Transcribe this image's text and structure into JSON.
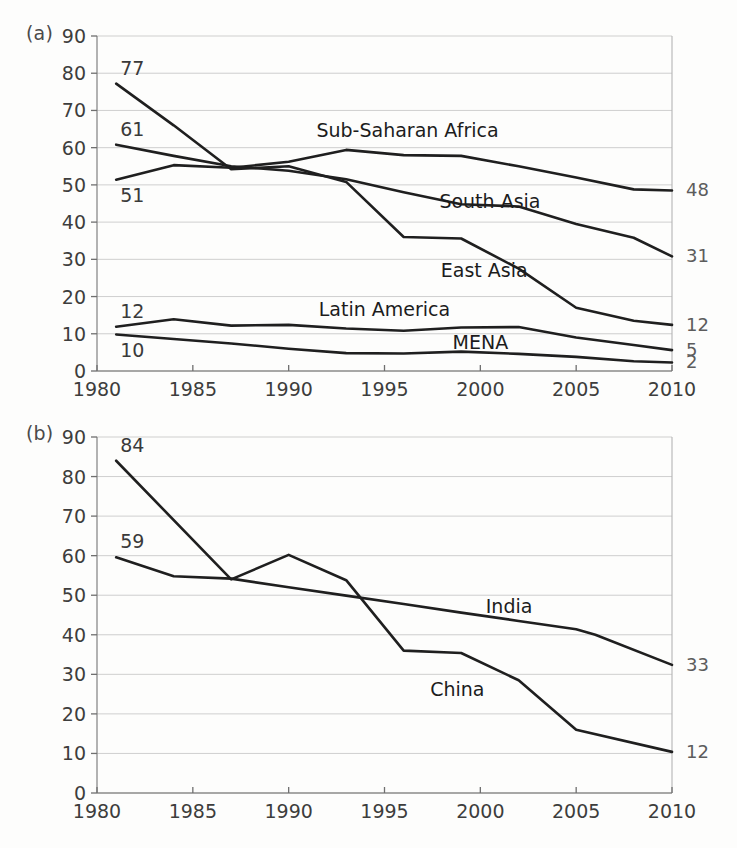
{
  "figure": {
    "background": "#fdfdfc",
    "line_color": "#1f1f1f",
    "grid_color": "#c9c9c9",
    "label_color": "#5c5c5c"
  },
  "panels": [
    {
      "tag": "(a)"
    },
    {
      "tag": "(b)"
    }
  ],
  "chart_data": [
    {
      "type": "line",
      "panel": "(a)",
      "title": "",
      "xlabel": "",
      "ylabel": "",
      "xlim": [
        1980,
        2010
      ],
      "ylim": [
        0,
        90
      ],
      "grid": true,
      "legend": "inline-annotations",
      "xticks": [
        1980,
        1985,
        1990,
        1995,
        2000,
        2005,
        2010
      ],
      "yticks": [
        0,
        10,
        20,
        30,
        40,
        50,
        60,
        70,
        80,
        90
      ],
      "series": [
        {
          "name": "Sub-Saharan Africa",
          "start_label": "51",
          "end_label": "48",
          "label_x": 1996.2,
          "label_y": 64.5,
          "x": [
            1981,
            1984,
            1987,
            1990,
            1993,
            1996,
            1999,
            2002,
            2005,
            2008,
            2010
          ],
          "values": [
            51.4,
            55.3,
            54.6,
            56.2,
            59.4,
            58.0,
            57.8,
            55.0,
            52.0,
            48.8,
            48.5
          ]
        },
        {
          "name": "South Asia",
          "start_label": "61",
          "end_label": "31",
          "label_x": 2000.5,
          "label_y": 45.5,
          "x": [
            1981,
            1984,
            1987,
            1990,
            1993,
            1996,
            1999,
            2002,
            2005,
            2008,
            2010
          ],
          "values": [
            60.8,
            57.8,
            55.0,
            53.8,
            51.5,
            48.0,
            44.8,
            44.2,
            39.5,
            35.8,
            30.8
          ]
        },
        {
          "name": "East Asia",
          "start_label": "77",
          "end_label": "12",
          "label_x": 2000.2,
          "label_y": 27.0,
          "x": [
            1981,
            1984,
            1987,
            1990,
            1993,
            1996,
            1999,
            2002,
            2005,
            2008,
            2010
          ],
          "values": [
            77.2,
            66.0,
            54.2,
            55.0,
            50.8,
            36.0,
            35.6,
            27.5,
            17.0,
            13.5,
            12.4
          ]
        },
        {
          "name": "Latin America",
          "start_label": "12",
          "end_label": "5",
          "label_x": 1995.0,
          "label_y": 16.5,
          "x": [
            1981,
            1984,
            1987,
            1990,
            1993,
            1996,
            1999,
            2002,
            2005,
            2008,
            2010
          ],
          "values": [
            11.9,
            13.9,
            12.2,
            12.4,
            11.4,
            10.8,
            11.7,
            11.8,
            9.0,
            7.0,
            5.6
          ]
        },
        {
          "name": "MENA",
          "start_label": "10",
          "end_label": "2",
          "label_x": 2000.0,
          "label_y": 7.5,
          "x": [
            1981,
            1984,
            1987,
            1990,
            1993,
            1996,
            1999,
            2002,
            2005,
            2008,
            2010
          ],
          "values": [
            9.8,
            8.6,
            7.4,
            6.0,
            4.8,
            4.7,
            5.2,
            4.6,
            3.8,
            2.6,
            2.3
          ]
        }
      ]
    },
    {
      "type": "line",
      "panel": "(b)",
      "title": "",
      "xlabel": "",
      "ylabel": "",
      "xlim": [
        1980,
        2010
      ],
      "ylim": [
        0,
        90
      ],
      "grid": true,
      "legend": "inline-annotations",
      "xticks": [
        1980,
        1985,
        1990,
        1995,
        2000,
        2005,
        2010
      ],
      "yticks": [
        0,
        10,
        20,
        30,
        40,
        50,
        60,
        70,
        80,
        90
      ],
      "series": [
        {
          "name": "China",
          "start_label": "84",
          "end_label": "12",
          "label_x": 1998.8,
          "label_y": 26.0,
          "x": [
            1981,
            1987,
            1990,
            1993,
            1996,
            1999,
            2002,
            2005,
            2010
          ],
          "values": [
            84.0,
            54.0,
            60.2,
            53.8,
            36.0,
            35.4,
            28.5,
            16.0,
            10.4
          ]
        },
        {
          "name": "India",
          "start_label": "59",
          "end_label": "33",
          "label_x": 2001.5,
          "label_y": 47.0,
          "x": [
            1981,
            1984,
            1987,
            1990,
            1993,
            1996,
            1999,
            2002,
            2005,
            2006,
            2010
          ],
          "values": [
            59.6,
            54.8,
            54.2,
            52.0,
            49.9,
            47.8,
            45.6,
            43.5,
            41.4,
            40.0,
            32.4
          ]
        }
      ]
    }
  ]
}
